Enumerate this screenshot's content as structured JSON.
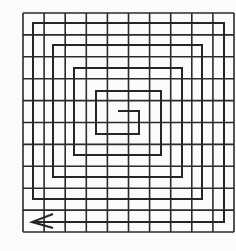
{
  "figure": {
    "colors": {
      "background": "#fbfbfb",
      "grid_line": "#2b2b2b",
      "spiral_line": "#262626"
    },
    "grid": {
      "rows": 10,
      "cols": 10,
      "x0": 23,
      "y0": 13,
      "x1": 234,
      "y1": 232,
      "stroke_width": 1.6
    },
    "spiral": {
      "stroke_width": 2,
      "points": [
        [
          118,
          111
        ],
        [
          139,
          111
        ],
        [
          139,
          134
        ],
        [
          96,
          134
        ],
        [
          96,
          91
        ],
        [
          161,
          91
        ],
        [
          161,
          155
        ],
        [
          74,
          155
        ],
        [
          74,
          68
        ],
        [
          182,
          68
        ],
        [
          182,
          177
        ],
        [
          53,
          177
        ],
        [
          53,
          45
        ],
        [
          202,
          45
        ],
        [
          202,
          199
        ],
        [
          33,
          199
        ],
        [
          33,
          23
        ],
        [
          224,
          23
        ],
        [
          224,
          222
        ],
        [
          33,
          222
        ]
      ],
      "arrow": {
        "direction": "left",
        "tip": [
          32,
          222
        ],
        "arm_top": [
          53,
          214
        ],
        "arm_bottom": [
          53,
          228
        ]
      }
    }
  }
}
